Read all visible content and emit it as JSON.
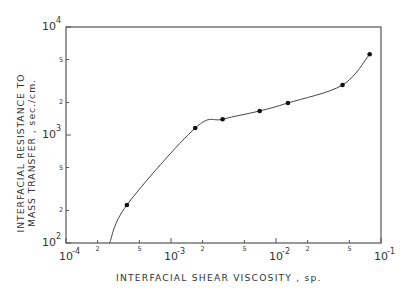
{
  "chart_data": {
    "type": "line",
    "title": "",
    "xlabel": "INTERFACIAL SHEAR VISCOSITY , sp.",
    "ylabel_line1": "INTERFACIAL RESISTANCE TO",
    "ylabel_line2": "MASS TRANSFER , sec./cm.",
    "xscale": "log",
    "yscale": "log",
    "xlim": [
      0.0001,
      0.1
    ],
    "ylim": [
      100,
      10000
    ],
    "grid": false,
    "legend": null,
    "x_major_ticks": [
      {
        "value": 0.0001,
        "base": "10",
        "exp": "-4"
      },
      {
        "value": 0.001,
        "base": "10",
        "exp": "-3"
      },
      {
        "value": 0.01,
        "base": "10",
        "exp": "-2"
      },
      {
        "value": 0.1,
        "base": "10",
        "exp": "-1"
      }
    ],
    "x_minor_ticks": [
      {
        "value": 0.0002,
        "label": "2"
      },
      {
        "value": 0.0005,
        "label": "5"
      },
      {
        "value": 0.002,
        "label": "2"
      },
      {
        "value": 0.005,
        "label": "5"
      },
      {
        "value": 0.02,
        "label": "2"
      },
      {
        "value": 0.05,
        "label": "5"
      }
    ],
    "y_major_ticks": [
      {
        "value": 100,
        "base": "10",
        "exp": "2"
      },
      {
        "value": 1000,
        "base": "10",
        "exp": "3"
      },
      {
        "value": 10000,
        "base": "10",
        "exp": "4"
      }
    ],
    "y_minor_ticks": [
      {
        "value": 200,
        "label": "2"
      },
      {
        "value": 500,
        "label": "5"
      },
      {
        "value": 2000,
        "label": "2"
      },
      {
        "value": 5000,
        "label": "5"
      }
    ],
    "series": [
      {
        "name": "measured",
        "marker": "circle",
        "points": [
          {
            "x": 0.00038,
            "y": 225
          },
          {
            "x": 0.0017,
            "y": 1160
          },
          {
            "x": 0.0031,
            "y": 1400
          },
          {
            "x": 0.007,
            "y": 1670
          },
          {
            "x": 0.013,
            "y": 1980
          },
          {
            "x": 0.043,
            "y": 2900
          },
          {
            "x": 0.078,
            "y": 5600
          }
        ]
      }
    ],
    "curve_start": {
      "x": 0.00026,
      "y": 100
    }
  }
}
